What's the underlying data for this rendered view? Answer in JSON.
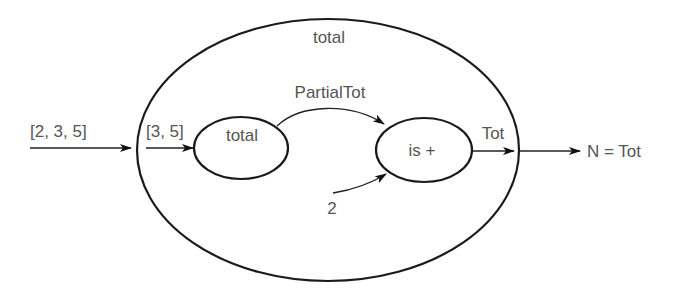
{
  "diagram": {
    "outer_node": {
      "label": "total"
    },
    "inner_nodes": [
      {
        "id": "total",
        "label": "total"
      },
      {
        "id": "is-plus",
        "label": "is +"
      }
    ],
    "edges": [
      {
        "from": "input",
        "to": "outer",
        "label": "[2, 3, 5]"
      },
      {
        "from": "outer-boundary",
        "to": "total",
        "label": "[3, 5]"
      },
      {
        "from": "total",
        "to": "is-plus",
        "label": "PartialTot"
      },
      {
        "from": "constant",
        "to": "is-plus",
        "label": "2"
      },
      {
        "from": "is-plus",
        "to": "outer-boundary",
        "label": "Tot"
      },
      {
        "from": "outer",
        "to": "output",
        "label": "N = Tot"
      }
    ],
    "colors": {
      "stroke": "#1a1a1a",
      "text": "#555555",
      "background": "#ffffff"
    }
  }
}
